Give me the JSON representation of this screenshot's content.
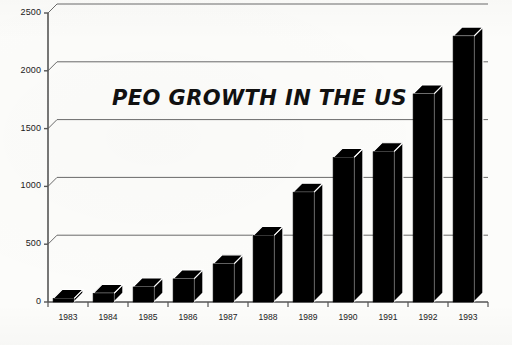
{
  "chart_data": {
    "type": "bar",
    "title": "PEO GROWTH IN THE US",
    "xlabel": "",
    "ylabel": "",
    "categories": [
      "1983",
      "1984",
      "1985",
      "1986",
      "1987",
      "1988",
      "1989",
      "1990",
      "1991",
      "1992",
      "1993"
    ],
    "values": [
      30,
      75,
      130,
      200,
      330,
      575,
      950,
      1250,
      1300,
      1800,
      2300
    ],
    "ylim": [
      0,
      2500
    ],
    "ytick_labels": [
      "0",
      "500",
      "1000",
      "1500",
      "2000",
      "2500"
    ],
    "ytick_values": [
      0,
      500,
      1000,
      1500,
      2000,
      2500
    ],
    "grid": true,
    "legend": "none",
    "style": "3d-extruded-black-bars",
    "bar_color": "#000000",
    "axis_color": "#555555",
    "grid_color": "#6a6a6a",
    "background_color": "#fcfcfa"
  },
  "figure": {
    "plot_left": 48,
    "plot_right": 488,
    "baseline_y": 302,
    "top_y": 13
  }
}
